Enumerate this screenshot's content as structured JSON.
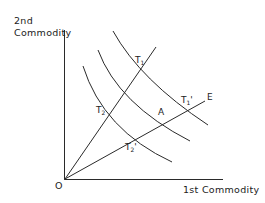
{
  "axes": {
    "y_label_line1": "2nd",
    "y_label_line2": "Commodity",
    "x_label": "1st Commodity",
    "origin_label": "O"
  },
  "rays": [
    {
      "name": "steep-ray",
      "label": ""
    },
    {
      "name": "ray-E",
      "label": "E"
    }
  ],
  "curves": [
    {
      "name": "outer-curve"
    },
    {
      "name": "middle-curve"
    },
    {
      "name": "inner-curve"
    }
  ],
  "points": {
    "T1": {
      "base": "T",
      "sub": "1",
      "prime": ""
    },
    "T2": {
      "base": "T",
      "sub": "2",
      "prime": ""
    },
    "T1p": {
      "base": "T",
      "sub": "1",
      "prime": "'"
    },
    "T2p": {
      "base": "T",
      "sub": "2",
      "prime": "'"
    },
    "A": {
      "base": "A"
    }
  },
  "colors": {
    "line": "#2a2a2a",
    "text": "#222222",
    "background": "#ffffff"
  }
}
